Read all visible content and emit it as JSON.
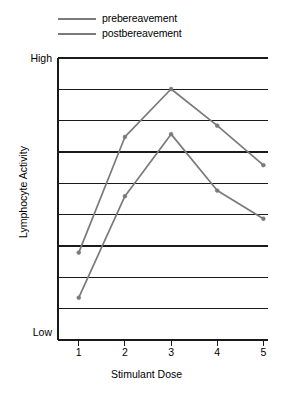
{
  "chart_data": {
    "type": "line",
    "title": "",
    "xlabel": "Stimulant Dose",
    "ylabel": "Lymphocyte Activity",
    "categories": [
      "1",
      "2",
      "3",
      "4",
      "5"
    ],
    "x": [
      1,
      2,
      3,
      4,
      5
    ],
    "xlim": [
      0.55,
      5.1
    ],
    "ylim": [
      0,
      10
    ],
    "ytick_labels": [
      "Low",
      "High"
    ],
    "ytick_values": [
      0.5,
      9.7
    ],
    "grid": true,
    "gridlines": 10,
    "legend_position": "top-left",
    "series": [
      {
        "name": "prebereavement",
        "color": "#7a7a7a",
        "values": [
          3.1,
          7.2,
          8.9,
          7.6,
          6.2
        ]
      },
      {
        "name": "postbereavement",
        "color": "#7a7a7a",
        "values": [
          1.5,
          5.1,
          7.3,
          5.3,
          4.3
        ]
      }
    ]
  },
  "legend": {
    "items": [
      {
        "label": "prebereavement",
        "color": "#7a7a7a"
      },
      {
        "label": "postbereavement",
        "color": "#7a7a7a"
      }
    ]
  },
  "axes": {
    "y_high_label": "High",
    "y_low_label": "Low",
    "y_axis_title": "Lymphocyte Activity",
    "x_axis_title": "Stimulant Dose",
    "x_tick_labels": [
      "1",
      "2",
      "3",
      "4",
      "5"
    ]
  },
  "colors": {
    "line": "#7a7a7a",
    "grid": "#1a1a1a",
    "axis": "#1a1a1a",
    "background": "#ffffff"
  }
}
